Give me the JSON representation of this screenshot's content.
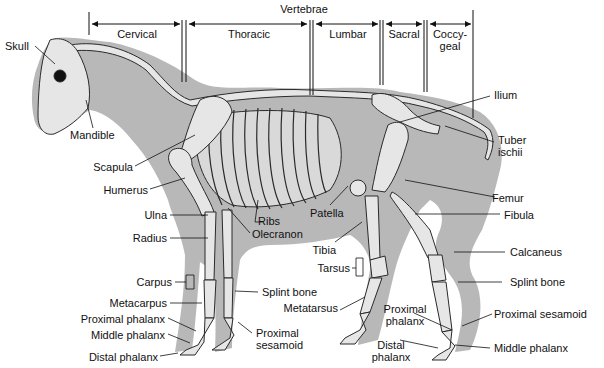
{
  "diagram": {
    "colors": {
      "silhouette": "#b5b5b5",
      "bone": "#e6e6e6",
      "bone_outline": "#2a2a2a",
      "line": "#111111",
      "background": "#ffffff"
    }
  },
  "vertebrae": {
    "title": "Vertebrae",
    "regions": [
      {
        "id": "cervical",
        "label": "Cervical"
      },
      {
        "id": "thoracic",
        "label": "Thoracic"
      },
      {
        "id": "lumbar",
        "label": "Lumbar"
      },
      {
        "id": "sacral",
        "label": "Sacral"
      },
      {
        "id": "coccygeal",
        "label_line1": "Coccy-",
        "label_line2": "geal"
      }
    ]
  },
  "labels": {
    "skull": "Skull",
    "mandible": "Mandible",
    "scapula": "Scapula",
    "humerus": "Humerus",
    "ulna": "Ulna",
    "radius": "Radius",
    "ribs": "Ribs",
    "olecranon": "Olecranon",
    "carpus": "Carpus",
    "metacarpus": "Metacarpus",
    "fore_splint_bone": "Splint bone",
    "fore_proximal_phalanx": "Proximal phalanx",
    "fore_middle_phalanx": "Middle phalanx",
    "fore_distal_phalanx": "Distal phalanx",
    "fore_proximal_sesamoid_line1": "Proximal",
    "fore_proximal_sesamoid_line2": "sesamoid",
    "ilium": "Ilium",
    "tuber_ischii_line1": "Tuber",
    "tuber_ischii_line2": "ischii",
    "femur": "Femur",
    "patella": "Patella",
    "fibula": "Fibula",
    "tibia": "Tibia",
    "tarsus": "Tarsus",
    "metatarsus": "Metatarsus",
    "calcaneus": "Calcaneus",
    "hind_splint_bone": "Splint bone",
    "hind_proximal_phalanx_line1": "Proximal",
    "hind_proximal_phalanx_line2": "phalanx",
    "hind_distal_phalanx_line1": "Distal",
    "hind_distal_phalanx_line2": "phalanx",
    "hind_proximal_sesamoid": "Proximal sesamoid",
    "hind_middle_phalanx": "Middle phalanx"
  }
}
